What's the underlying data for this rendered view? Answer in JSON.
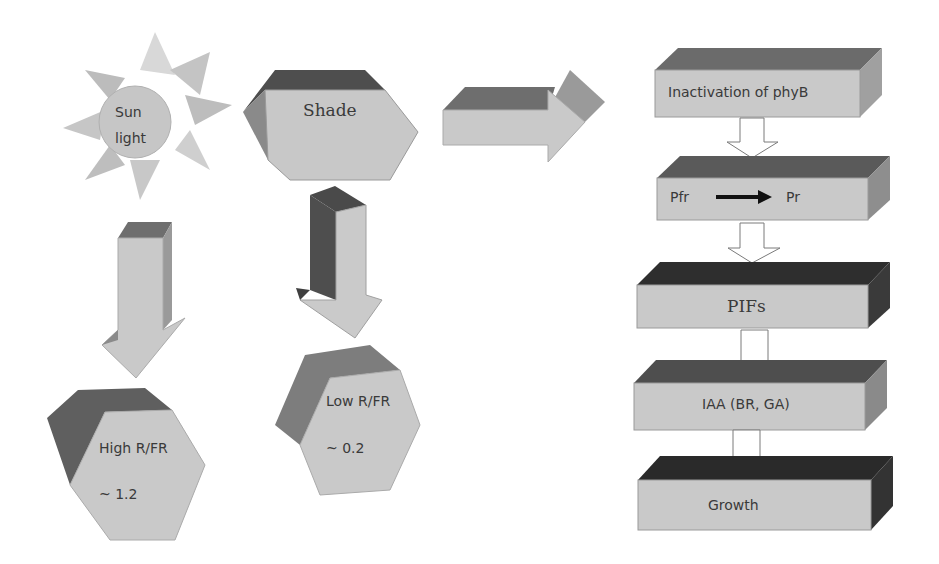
{
  "left": {
    "sun": {
      "line1": "Sun",
      "line2": "light"
    },
    "shade": {
      "label": "Shade"
    },
    "high": {
      "label": "High R/FR",
      "value": "~ 1.2"
    },
    "low": {
      "label": "Low R/FR",
      "value": "~ 0.2"
    }
  },
  "flow": {
    "steps": [
      {
        "label": "Inactivation of phyB"
      },
      {
        "from": "Pfr",
        "to": "Pr"
      },
      {
        "label": "PIFs"
      },
      {
        "label": "IAA (BR, GA)"
      },
      {
        "label": "Growth"
      }
    ]
  },
  "colors": {
    "face": "#c9c9c9",
    "top_mid": "#6e6e6e",
    "top_dark": "#3a3a3a",
    "side": "#9a9a9a",
    "text": "#3a3a3a"
  }
}
